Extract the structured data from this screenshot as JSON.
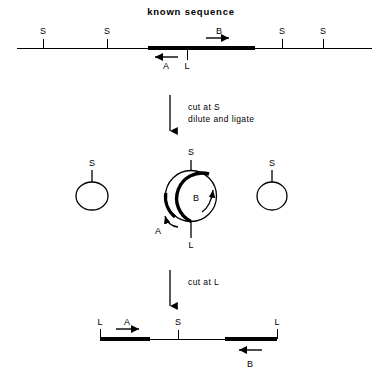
{
  "figure": {
    "title": "known sequence",
    "width": 382,
    "height": 379,
    "ink_color": "#000000",
    "background_color": "#ffffff"
  },
  "panel_top": {
    "name": "linear genomic map",
    "site_labels": [
      "S",
      "S",
      "S",
      "S"
    ],
    "probe_label_right": "B",
    "probe_label_left": "A",
    "linker_label": "L"
  },
  "step_one": {
    "line1": "cut at S",
    "line2": "dilute and ligate"
  },
  "panel_middle": {
    "name": "circularized ligation products",
    "main_circle": {
      "top_label": "S",
      "bottom_label": "L",
      "primer_label_right": "B",
      "primer_label_left": "A"
    },
    "left_circle": {
      "label": "S"
    },
    "right_circle": {
      "label": "S"
    }
  },
  "step_two": {
    "line1": "cut at L"
  },
  "panel_bottom": {
    "name": "linearized product",
    "left_end_label": "L",
    "left_primer_label": "A",
    "middle_site_label": "S",
    "right_end_label": "L",
    "right_primer_label": "B"
  }
}
